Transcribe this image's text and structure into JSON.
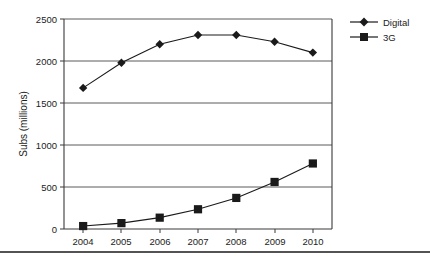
{
  "chart_data": {
    "type": "line",
    "title": "",
    "xlabel": "",
    "ylabel": "Subs (millions)",
    "categories": [
      "2004",
      "2005",
      "2006",
      "2007",
      "2008",
      "2009",
      "2010"
    ],
    "series": [
      {
        "name": "Digital",
        "marker": "diamond",
        "color": "#1a1a1a",
        "values": [
          1680,
          1980,
          2200,
          2310,
          2310,
          2230,
          2100
        ]
      },
      {
        "name": "3G",
        "marker": "square",
        "color": "#1a1a1a",
        "values": [
          35,
          70,
          135,
          235,
          370,
          560,
          780
        ]
      }
    ],
    "ylim": [
      0,
      2500
    ],
    "ytick_values": [
      0,
      500,
      1000,
      1500,
      2000,
      2500
    ],
    "ytick_labels": [
      "0",
      "500",
      "1000",
      "1500",
      "2000",
      "2500"
    ],
    "grid": "horizontal",
    "legend_position": "right"
  },
  "legend": {
    "entries": [
      {
        "label": "Digital",
        "marker": "diamond-marker"
      },
      {
        "label": "3G",
        "marker": "square-marker"
      }
    ]
  },
  "axes": {
    "y_title": "Subs (millions)",
    "y_ticks": [
      "2500",
      "2000",
      "1500",
      "1000",
      "500",
      "0"
    ],
    "x_ticks": [
      "2004",
      "2005",
      "2006",
      "2007",
      "2008",
      "2009",
      "2010"
    ]
  },
  "footer": {
    "rule": ""
  }
}
